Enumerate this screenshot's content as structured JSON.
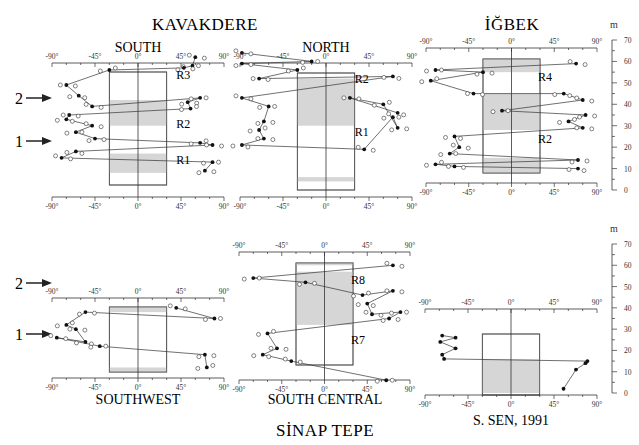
{
  "figure": {
    "titles": {
      "kavakdere": "KAVAKDERE",
      "igbek": "İĞBEK",
      "sinap_tepe": "SİNAP TEPE"
    },
    "height_unit": "m",
    "height_ticks": [
      "0",
      "10",
      "20",
      "30",
      "40",
      "50",
      "60",
      "70"
    ],
    "angle_ticks": [
      "-90°",
      "-45°",
      "0°",
      "45°",
      "90°"
    ],
    "arrows": [
      {
        "label": "2"
      },
      {
        "label": "1"
      }
    ]
  },
  "chart_data": [
    {
      "type": "scatter",
      "title": "SOUTH",
      "group": "KAVAKDERE",
      "xlabel": "Inclination (°)",
      "ylabel": "m",
      "xlim": [
        -90,
        90
      ],
      "ylim": [
        0,
        70
      ],
      "zones": [
        "R1",
        "R2",
        "R3"
      ],
      "shaded_bands_m": [
        [
          8,
          17
        ],
        [
          30,
          42
        ],
        [
          55,
          70
        ]
      ],
      "series": [
        {
          "name": "path (filled)",
          "points": [
            [
              60,
              62
            ],
            [
              57,
              58
            ],
            [
              48,
              57
            ],
            [
              -30,
              56
            ],
            [
              -75,
              49
            ],
            [
              -62,
              44
            ],
            [
              -48,
              39
            ],
            [
              65,
              43
            ],
            [
              52,
              41
            ],
            [
              55,
              38
            ],
            [
              -72,
              35
            ],
            [
              -75,
              33
            ],
            [
              -48,
              30
            ],
            [
              -65,
              27
            ],
            [
              -45,
              24
            ],
            [
              65,
              22
            ],
            [
              78,
              21
            ],
            [
              -65,
              18
            ],
            [
              -80,
              15
            ],
            [
              78,
              13
            ],
            [
              70,
              9
            ]
          ]
        }
      ]
    },
    {
      "type": "scatter",
      "title": "NORTH",
      "group": "KAVAKDERE",
      "xlim": [
        -90,
        90
      ],
      "ylim": [
        0,
        70
      ],
      "zones": [
        "R1",
        "R2"
      ],
      "shaded_bands_m": [
        [
          4,
          6
        ],
        [
          30,
          52
        ]
      ],
      "series": [
        {
          "name": "path (filled)",
          "points": [
            [
              -88,
              64
            ],
            [
              -15,
              60
            ],
            [
              -88,
              59
            ],
            [
              -30,
              56
            ],
            [
              -70,
              52
            ],
            [
              70,
              53
            ],
            [
              -88,
              43
            ],
            [
              -60,
              39
            ],
            [
              -65,
              32
            ],
            [
              -70,
              28
            ],
            [
              -65,
              24
            ],
            [
              -88,
              21
            ],
            [
              40,
              19
            ],
            [
              70,
              34
            ],
            [
              75,
              29
            ],
            [
              60,
              40
            ],
            [
              25,
              43
            ],
            [
              75,
              36
            ]
          ]
        }
      ]
    },
    {
      "type": "scatter",
      "title": "İĞBEK",
      "xlim": [
        -90,
        90
      ],
      "ylim": [
        0,
        70
      ],
      "zones": [
        "R2",
        "R4"
      ],
      "shaded_bands_m": [
        [
          8,
          15
        ],
        [
          28,
          45
        ],
        [
          55,
          62
        ]
      ],
      "series": [
        {
          "name": "path (filled)",
          "points": [
            [
              68,
              59
            ],
            [
              -80,
              56
            ],
            [
              -30,
              55
            ],
            [
              -85,
              51
            ],
            [
              -40,
              45
            ],
            [
              55,
              45
            ],
            [
              75,
              42
            ],
            [
              -10,
              37
            ],
            [
              78,
              35
            ],
            [
              60,
              32
            ],
            [
              75,
              29
            ],
            [
              -60,
              25
            ],
            [
              -55,
              20
            ],
            [
              -65,
              17
            ],
            [
              70,
              14
            ],
            [
              -80,
              12
            ],
            [
              -60,
              11
            ],
            [
              70,
              10
            ]
          ]
        }
      ]
    },
    {
      "type": "scatter",
      "title": "SOUTHWEST",
      "group": "SİNAP TEPE",
      "xlim": [
        -90,
        90
      ],
      "ylim": [
        0,
        70
      ],
      "shaded_bands_m": [
        [
          5,
          12
        ],
        [
          38,
          45
        ]
      ],
      "series": [
        {
          "name": "path (filled)",
          "points": [
            [
              40,
              40
            ],
            [
              80,
              35
            ],
            [
              -55,
              38
            ],
            [
              -75,
              32
            ],
            [
              -65,
              30
            ],
            [
              -55,
              24
            ],
            [
              -85,
              26
            ],
            [
              -40,
              22
            ],
            [
              70,
              18
            ],
            [
              72,
              12
            ]
          ]
        }
      ]
    },
    {
      "type": "scatter",
      "title": "SOUTH CENTRAL",
      "group": "SİNAP TEPE",
      "xlim": [
        -90,
        90
      ],
      "ylim": [
        0,
        70
      ],
      "zones": [
        "R7",
        "R8"
      ],
      "shaded_bands_m": [
        [
          2,
          5
        ],
        [
          32,
          57
        ],
        [
          60,
          63
        ]
      ],
      "series": [
        {
          "name": "path (filled)",
          "points": [
            [
              72,
              60
            ],
            [
              -75,
              54
            ],
            [
              -20,
              52
            ],
            [
              40,
              46
            ],
            [
              72,
              48
            ],
            [
              45,
              42
            ],
            [
              50,
              37
            ],
            [
              80,
              38
            ],
            [
              68,
              35
            ],
            [
              -60,
              28
            ],
            [
              -50,
              21
            ],
            [
              -65,
              18
            ],
            [
              -35,
              15
            ],
            [
              65,
              6
            ]
          ]
        }
      ]
    },
    {
      "type": "line",
      "title": "S. SEN, 1991",
      "xlim": [
        -90,
        90
      ],
      "ylim": [
        0,
        70
      ],
      "shaded_bands_m": [
        [
          0,
          16
        ]
      ],
      "series": [
        {
          "name": "S. Sen 1991",
          "points": [
            [
              55,
              2
            ],
            [
              68,
              11
            ],
            [
              78,
              14
            ],
            [
              80,
              15
            ],
            [
              -70,
              16
            ],
            [
              -72,
              18
            ],
            [
              -58,
              21
            ],
            [
              -74,
              24
            ],
            [
              -58,
              26
            ],
            [
              -72,
              27
            ]
          ]
        }
      ]
    }
  ]
}
